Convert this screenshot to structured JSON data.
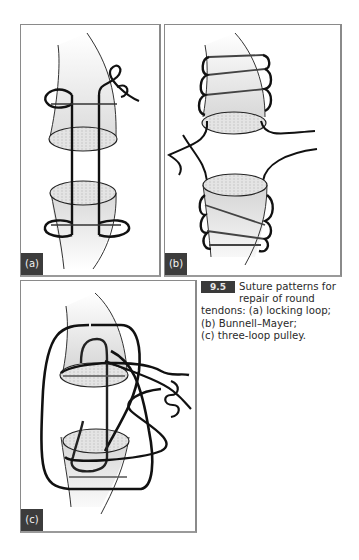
{
  "figure": {
    "number": "9.5",
    "caption": {
      "line1": "Suture patterns for",
      "line2": "repair of round",
      "line3": "tendons: (a) locking loop;",
      "line4": "(b) Bunnell–Mayer;",
      "line5": "(c) three-loop pulley."
    },
    "panels": [
      {
        "label": "(a)",
        "title": "locking loop"
      },
      {
        "label": "(b)",
        "title": "Bunnell–Mayer"
      },
      {
        "label": "(c)",
        "title": "three-loop pulley"
      }
    ],
    "colors": {
      "badge_bg": "#3a3a3a",
      "label_bg": "#3c3c3c",
      "suture": "#111111",
      "tendon_fill": "#e6e6e6",
      "border": "#8a8a8a"
    }
  }
}
